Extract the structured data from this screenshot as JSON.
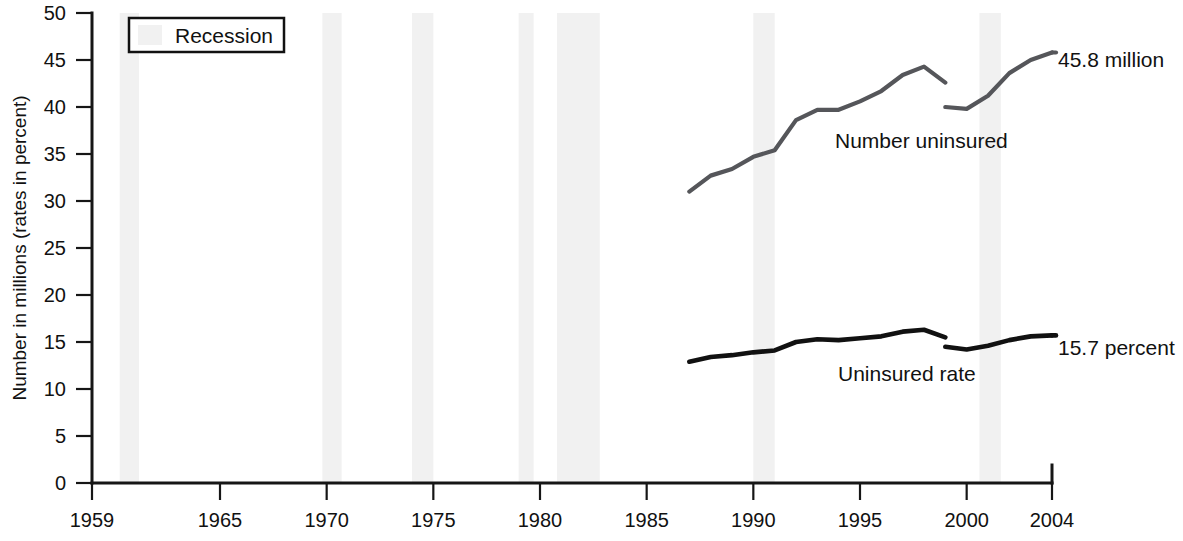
{
  "chart_data": {
    "type": "line",
    "title": "",
    "xlabel": "",
    "ylabel": "Number in millions (rates in percent)",
    "xlim": [
      1959,
      2004
    ],
    "ylim": [
      0,
      50
    ],
    "grid": false,
    "legend_position": "top-left",
    "y_ticks": [
      0,
      5,
      10,
      15,
      20,
      25,
      30,
      35,
      40,
      45,
      50
    ],
    "y_tick_labels": [
      "0",
      "5",
      "10",
      "15",
      "20",
      "25",
      "30",
      "35",
      "40",
      "45",
      "50"
    ],
    "x_ticks": [
      1959,
      1965,
      1970,
      1975,
      1980,
      1985,
      1990,
      1995,
      2000,
      2004
    ],
    "x_tick_labels": [
      "1959",
      "1965",
      "1970",
      "1975",
      "1980",
      "1985",
      "1990",
      "1995",
      "2000",
      "2004"
    ],
    "legend": [
      {
        "label": "Recession",
        "color": "#f1f1f1"
      }
    ],
    "series": [
      {
        "name": "Number uninsured",
        "color": "#55565a",
        "units": "millions",
        "label_position": "inside-right",
        "segments": [
          {
            "x": [
              1987,
              1988,
              1989,
              1990,
              1991,
              1992,
              1993,
              1994,
              1995,
              1996,
              1997,
              1998,
              1999
            ],
            "values": [
              31.0,
              32.7,
              33.4,
              34.7,
              35.4,
              38.6,
              39.7,
              39.7,
              40.6,
              41.7,
              43.4,
              44.3,
              42.6
            ]
          },
          {
            "x": [
              1999,
              2000,
              2001,
              2002,
              2003,
              2004
            ],
            "values": [
              40.0,
              39.8,
              41.2,
              43.6,
              45.0,
              45.8
            ]
          }
        ]
      },
      {
        "name": "Uninsured rate",
        "color": "#111111",
        "units": "percent",
        "label_position": "inside-right",
        "segments": [
          {
            "x": [
              1987,
              1988,
              1989,
              1990,
              1991,
              1992,
              1993,
              1994,
              1995,
              1996,
              1997,
              1998,
              1999
            ],
            "values": [
              12.9,
              13.4,
              13.6,
              13.9,
              14.1,
              15.0,
              15.3,
              15.2,
              15.4,
              15.6,
              16.1,
              16.3,
              15.5
            ]
          },
          {
            "x": [
              1999,
              2000,
              2001,
              2002,
              2003,
              2004
            ],
            "values": [
              14.5,
              14.2,
              14.6,
              15.2,
              15.6,
              15.7
            ]
          }
        ]
      }
    ],
    "recessions": [
      {
        "start": 1960.3,
        "end": 1961.2
      },
      {
        "start": 1969.8,
        "end": 1970.7
      },
      {
        "start": 1974.0,
        "end": 1975.0
      },
      {
        "start": 1979.0,
        "end": 1979.7
      },
      {
        "start": 1980.8,
        "end": 1982.8
      },
      {
        "start": 1990.0,
        "end": 1991.0
      },
      {
        "start": 2000.6,
        "end": 2001.6
      }
    ],
    "annotations": [
      {
        "name": "number-end-label",
        "text": "45.8 million",
        "x": 1055,
        "y": 60
      },
      {
        "name": "rate-end-label",
        "text": "15.7 percent",
        "x": 1055,
        "y": 348
      },
      {
        "name": "number-series-label",
        "text": "Number uninsured",
        "x": 835,
        "y": 148
      },
      {
        "name": "rate-series-label",
        "text": "Uninsured rate",
        "x": 838,
        "y": 381
      }
    ]
  },
  "axis": {
    "ylabel": "Number in millions (rates in percent)"
  },
  "legend": {
    "recession_label": "Recession"
  },
  "labels": {
    "number_series": "Number uninsured",
    "rate_series": "Uninsured rate",
    "number_end": "45.8 million",
    "rate_end": "15.7 percent"
  },
  "y_ticks": {
    "t0": "0",
    "t1": "5",
    "t2": "10",
    "t3": "15",
    "t4": "20",
    "t5": "25",
    "t6": "30",
    "t7": "35",
    "t8": "40",
    "t9": "45",
    "t10": "50"
  },
  "x_ticks": {
    "t0": "1959",
    "t1": "1965",
    "t2": "1970",
    "t3": "1975",
    "t4": "1980",
    "t5": "1985",
    "t6": "1990",
    "t7": "1995",
    "t8": "2000",
    "t9": "2004"
  }
}
